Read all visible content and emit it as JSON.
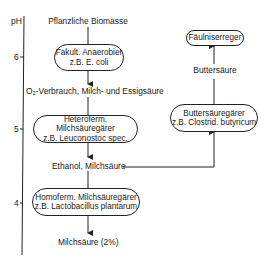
{
  "axis": {
    "label": "pH",
    "ticks": [
      "6",
      "5",
      "4"
    ]
  },
  "left_column": {
    "source": "Pflanzliche Biomasse",
    "box1": {
      "line1": "Fakult. Anaerobier",
      "line2": "z.B. E. coli"
    },
    "product1": "O₂-Verbrauch, Milch- und Essigsäure",
    "box2": {
      "line1": "Heteroferm. Milchsäuregärer",
      "line2": "z.B. Leuconostoc spec."
    },
    "product2": "Ethanol, Milchsäure",
    "box3": {
      "line1": "Homoferm. Milchsäuregärer",
      "line2": "z.B. Lactobacillus plantarum"
    },
    "product3": "Milchsäure (2%)"
  },
  "right_column": {
    "box_top": {
      "line1": "Fäulniserreger"
    },
    "product": "Buttersäure",
    "box_bottom": {
      "line1": "Buttersäuregärer",
      "line2": "z.B. Clostrid. butyricum"
    }
  }
}
